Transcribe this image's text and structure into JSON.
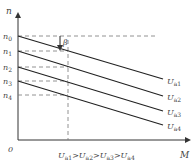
{
  "diagram": {
    "axes": {
      "y_label": "n",
      "x_label": "M",
      "origin_label": "0"
    },
    "speed_levels": [
      {
        "label": "n",
        "sub": "0"
      },
      {
        "label": "n",
        "sub": "1"
      },
      {
        "label": "n",
        "sub": "2"
      },
      {
        "label": "n",
        "sub": "3"
      },
      {
        "label": "n",
        "sub": "4"
      }
    ],
    "lines": [
      {
        "label": "U",
        "sub": "a1"
      },
      {
        "label": "U",
        "sub": "a2"
      },
      {
        "label": "U",
        "sub": "a3"
      },
      {
        "label": "U",
        "sub": "a4"
      }
    ],
    "angle_label": "β",
    "relation": {
      "parts": [
        "U",
        "a1",
        ">",
        "U",
        "a2",
        ">",
        "U",
        "a3",
        ">",
        "U",
        "a4"
      ]
    },
    "colors": {
      "line": "#222222",
      "dash": "#777777",
      "text": "#444444"
    }
  }
}
